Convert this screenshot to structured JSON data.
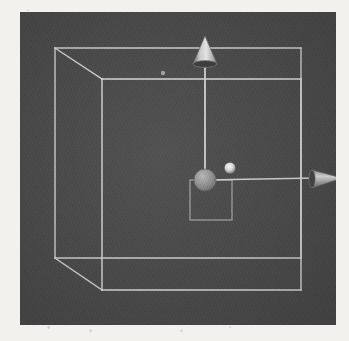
{
  "viewport": {
    "name": "3d-viewport",
    "background_color": "#4a4a4a",
    "bounds": {
      "x": 20,
      "y": 12,
      "width": 316,
      "height": 313
    },
    "render_mode": "wireframe"
  },
  "scene": {
    "bounding_box": {
      "name": "selection-bounding-box",
      "color": "#d5d5d5",
      "line_width": 1.4,
      "front_face": {
        "left": 82,
        "right": 281,
        "top": 67,
        "bottom": 278
      },
      "back_face": {
        "left": 35,
        "right": 281,
        "top": 36,
        "bottom": 246
      }
    },
    "gizmo": {
      "name": "transform-gizmo",
      "type": "translate",
      "origin": {
        "x": 185,
        "y": 168
      },
      "handle_color": "#9a9a9a",
      "axis_color": "#cfcfcf",
      "axes": [
        {
          "name": "y-axis-handle",
          "label": "Y",
          "direction": "up",
          "arrow_tip": {
            "x": 185,
            "y": 26
          },
          "arrow_base": {
            "x": 185,
            "y": 50
          },
          "color": "#d9d9d9"
        },
        {
          "name": "x-axis-handle",
          "label": "X",
          "direction": "right",
          "arrow_tip": {
            "x": 320,
            "y": 166
          },
          "arrow_base": {
            "x": 292,
            "y": 166
          },
          "color": "#c9c9c9"
        }
      ],
      "plane_handle": {
        "name": "xy-plane-handle",
        "x": 170,
        "y": 168,
        "width": 42,
        "height": 40,
        "color": "#b0b0b0"
      },
      "center_handle": {
        "name": "origin-sphere-handle",
        "cx": 185,
        "cy": 168,
        "r": 11,
        "color": "#8f8f8f"
      }
    },
    "markers": [
      {
        "name": "highlight-vertex-dot",
        "cx": 210,
        "cy": 156,
        "r": 5.5,
        "color": "#e8e8e8"
      },
      {
        "name": "faint-vertex-dot",
        "cx": 143,
        "cy": 61,
        "r": 2.2,
        "color": "#bdbdbd"
      }
    ]
  },
  "labels": {
    "y_axis": "Y",
    "x_axis": "X",
    "origin": "Origin"
  }
}
